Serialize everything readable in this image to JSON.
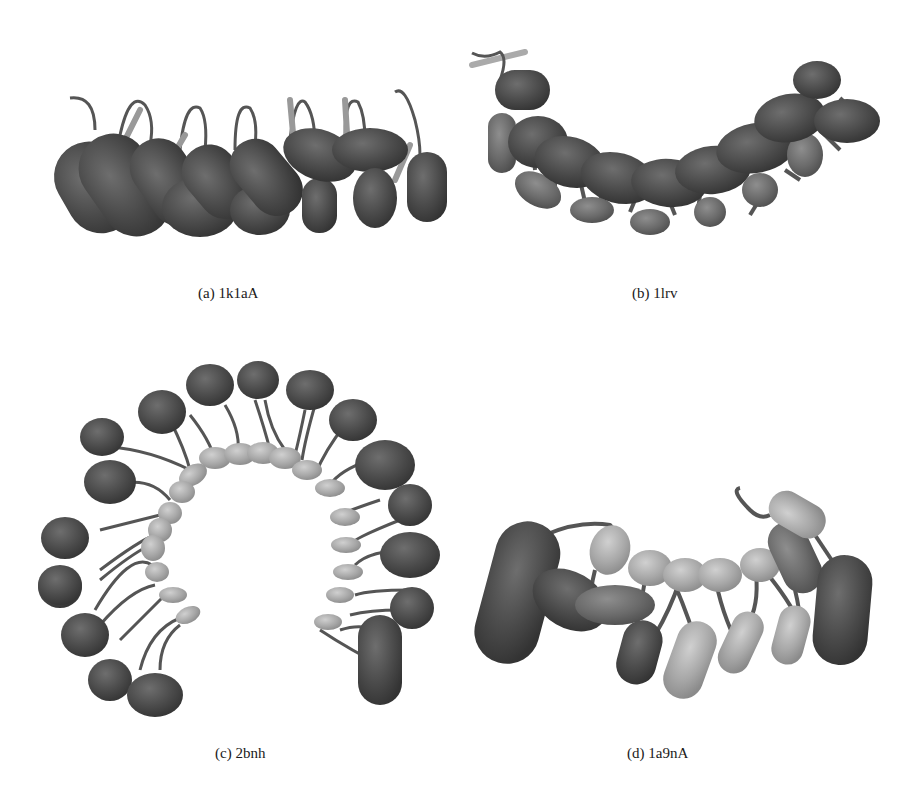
{
  "figure": {
    "colors": {
      "background": "#ffffff",
      "helix_dark": "#4a4a4a",
      "helix_mid": "#6a6a6a",
      "helix_light": "#a8a8a8",
      "loop": "#555555",
      "strand": "#b5b5b5",
      "caption_text": "#1a1a1a"
    },
    "panels": [
      {
        "id": "a",
        "label": "(a)",
        "name": "1k1aA",
        "caption": "(a) 1k1aA"
      },
      {
        "id": "b",
        "label": "(b)",
        "name": "1lrv",
        "caption": "(b) 1lrv"
      },
      {
        "id": "c",
        "label": "(c)",
        "name": "2bnh",
        "caption": "(c) 2bnh"
      },
      {
        "id": "d",
        "label": "(d)",
        "name": "1a9nA",
        "caption": "(d) 1a9nA"
      }
    ]
  }
}
